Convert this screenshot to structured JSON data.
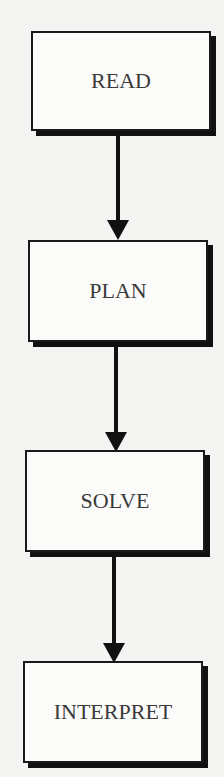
{
  "flowchart": {
    "steps": [
      {
        "label": "READ"
      },
      {
        "label": "PLAN"
      },
      {
        "label": "SOLVE"
      },
      {
        "label": "INTERPRET"
      }
    ],
    "arrows": [
      {
        "from": "READ",
        "to": "PLAN"
      },
      {
        "from": "PLAN",
        "to": "SOLVE"
      },
      {
        "from": "SOLVE",
        "to": "INTERPRET"
      }
    ]
  }
}
